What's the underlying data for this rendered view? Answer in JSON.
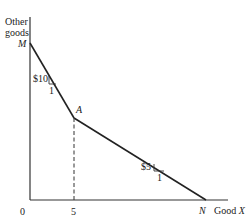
{
  "diagram": {
    "type": "budget-constraint",
    "y_axis_label_line1": "Other",
    "y_axis_label_line2": "goods",
    "x_axis_label": "Good X",
    "x_axis_label_good": "Good",
    "x_axis_label_var": "X",
    "origin_label": "0",
    "x_tick_label": "5",
    "points": {
      "M": "M",
      "A": "A",
      "N": "N"
    },
    "segments": [
      {
        "from": "M",
        "to": "A",
        "slope_label": "$10",
        "run_label": "1"
      },
      {
        "from": "A",
        "to": "N",
        "slope_label": "$5",
        "run_label": "1"
      }
    ],
    "line_color": "#222222",
    "axis_color": "#333333"
  }
}
